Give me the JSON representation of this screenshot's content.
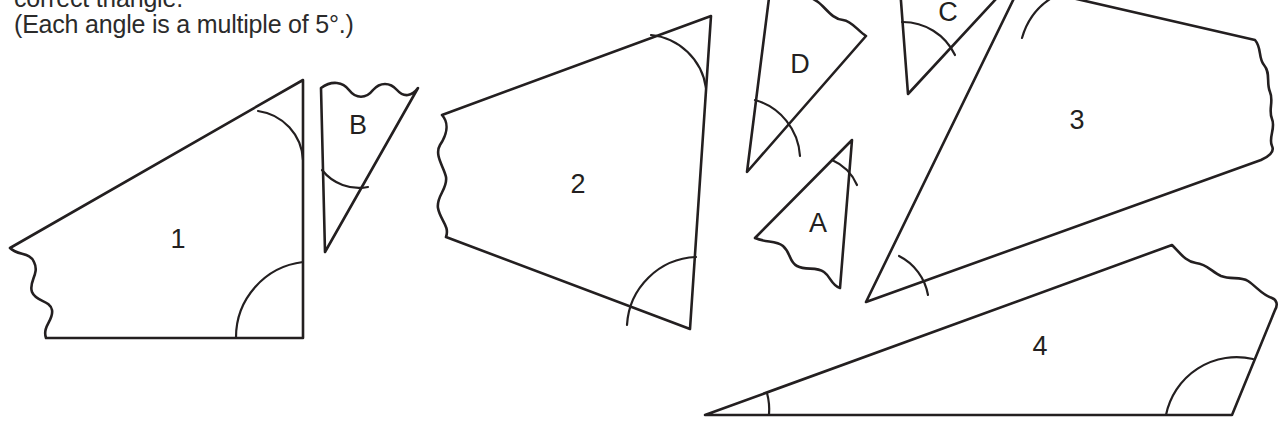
{
  "worksheet": {
    "instructions": {
      "line1": "correct triangle.",
      "line2": "(Each angle is a multiple of 5°.)"
    },
    "ink_color": "#231f20",
    "background_color": "#ffffff",
    "numbered_pieces": [
      {
        "label": "1",
        "x": 178,
        "y": 241,
        "marked_angles": 2,
        "torn_edge": "left"
      },
      {
        "label": "2",
        "x": 578,
        "y": 186,
        "marked_angles": 2,
        "torn_edge": "left"
      },
      {
        "label": "3",
        "x": 1077,
        "y": 122,
        "marked_angles": 2,
        "torn_edge": "right"
      },
      {
        "label": "4",
        "x": 1040,
        "y": 348,
        "marked_angles": 2,
        "torn_edge": "right"
      }
    ],
    "lettered_pieces": [
      {
        "label": "A",
        "x": 818,
        "y": 225,
        "marked_angles": 1,
        "torn_edge": "bottom"
      },
      {
        "label": "B",
        "x": 358,
        "y": 127,
        "marked_angles": 1,
        "torn_edge": "top"
      },
      {
        "label": "C",
        "x": 948,
        "y": 14,
        "marked_angles": 1,
        "torn_edge": "top"
      },
      {
        "label": "D",
        "x": 800,
        "y": 66,
        "marked_angles": 1,
        "torn_edge": "top-right"
      }
    ]
  }
}
